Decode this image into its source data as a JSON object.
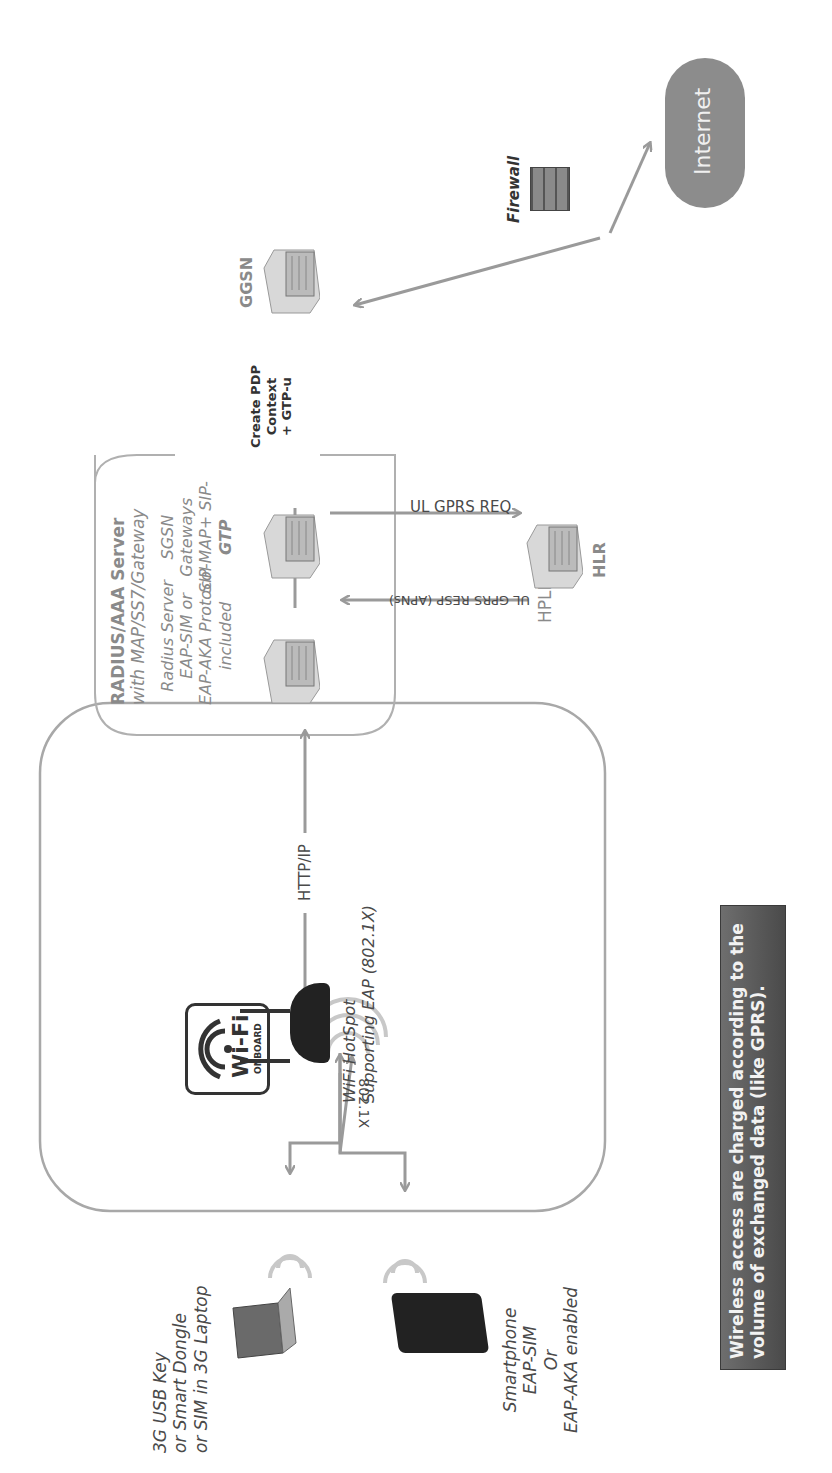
{
  "diagram": {
    "colors": {
      "arrow": "#9a9a9a",
      "box_border": "#a8a8a8",
      "text": "#4a4a4a",
      "note_bg": "#5a5a5a",
      "note_text": "#f2f2f2",
      "cloud": "#8c8c8c"
    },
    "clients": {
      "laptop_label": [
        "3G USB Key",
        "or Smart Dongle",
        "or SIM in 3G Laptop"
      ],
      "smartphone_label": [
        "Smartphone",
        "EAP-SIM",
        "Or",
        "EAP-AKA enabled"
      ],
      "link_label": "802.1X"
    },
    "hotspot": {
      "badge_main": "Wi-Fi",
      "badge_sub": "ONBOARD",
      "label": [
        "WiFi HotSpot",
        "Supporting EAP (802.1X)"
      ],
      "uplink_label": "HTTP/IP"
    },
    "hplmn": {
      "label": "HPLMN",
      "aaa_box": {
        "title": "RADIUS/AAA Server",
        "subtitle": "with MAP/SS7/Gateway",
        "radius_label": [
          "Radius Server",
          "EAP-SIM or",
          "EAP-AKA Protocol",
          "included"
        ],
        "sgsn_label": [
          "SGSN",
          "Gateways",
          "SIP-MAP+ SIP-",
          "GTP"
        ]
      },
      "pdp_label": [
        "Create PDP",
        "Context",
        "+ GTP-u"
      ],
      "ul_req": "UL  GPRS REQ",
      "ul_resp": "UL GPRS RESP (APNs)",
      "hlr": "HLR",
      "ggsn": "GGSN"
    },
    "firewall": "Firewall",
    "internet": "Internet",
    "note": [
      "Wireless access are charged according to the",
      "volume of exchanged data (like GPRS)."
    ]
  }
}
